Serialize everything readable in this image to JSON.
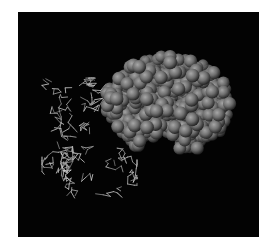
{
  "figure": {
    "background": "#030303",
    "page_background": "#ffffff",
    "frame": {
      "x": 18,
      "y": 12,
      "width": 241,
      "height": 225
    }
  },
  "sphere_model": {
    "label": "space-filling model",
    "color_light": "#9a9a9a",
    "color_mid": "#6b6b6b",
    "color_dark": "#2a2a2a",
    "radius": 6,
    "outline": [
      [
        118,
        78
      ],
      [
        135,
        62
      ],
      [
        150,
        58
      ],
      [
        168,
        54
      ],
      [
        182,
        58
      ],
      [
        198,
        62
      ],
      [
        214,
        70
      ],
      [
        226,
        84
      ],
      [
        232,
        100
      ],
      [
        230,
        118
      ],
      [
        222,
        132
      ],
      [
        208,
        140
      ],
      [
        196,
        150
      ],
      [
        186,
        152
      ],
      [
        176,
        146
      ],
      [
        170,
        134
      ],
      [
        160,
        130
      ],
      [
        150,
        140
      ],
      [
        140,
        148
      ],
      [
        128,
        144
      ],
      [
        120,
        132
      ],
      [
        112,
        120
      ],
      [
        104,
        106
      ],
      [
        106,
        92
      ]
    ]
  },
  "wire_model": {
    "label": "stick model",
    "color": "#bdbdbd",
    "bounds": {
      "x": 42,
      "y": 78,
      "width": 95,
      "height": 125
    },
    "segments": 320,
    "seed": 7
  }
}
